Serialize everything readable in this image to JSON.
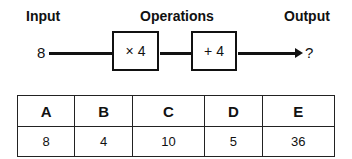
{
  "headings": {
    "input": "Input",
    "operations": "Operations",
    "output": "Output"
  },
  "diagram": {
    "input_value": "8",
    "operation_1": "× 4",
    "operation_2": "+ 4",
    "output_value": "?"
  },
  "table": {
    "headers": [
      "A",
      "B",
      "C",
      "D",
      "E"
    ],
    "values": [
      "8",
      "4",
      "10",
      "5",
      "36"
    ]
  }
}
